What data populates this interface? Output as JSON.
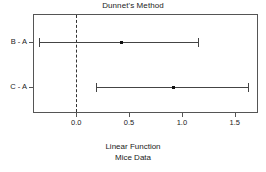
{
  "chart_data": {
    "type": "errorbar",
    "title": "Dunnet's Method",
    "xlabel_line1": "Linear Function",
    "xlabel_line2": "Mice Data",
    "ylabel": "",
    "xlim": [
      -0.4,
      1.73
    ],
    "xticks": [
      0.0,
      0.5,
      1.0,
      1.5
    ],
    "xticklabels": [
      "0.0",
      "0.5",
      "1.0",
      "1.5"
    ],
    "grid": false,
    "legend": "none",
    "reference_line": {
      "value": 0.0,
      "style": "dashed",
      "color": "#333333"
    },
    "categories": [
      "B - A",
      "C - A"
    ],
    "series": [
      {
        "name": "B - A",
        "estimate": 0.42,
        "lower": -0.35,
        "upper": 1.15
      },
      {
        "name": "C - A",
        "estimate": 0.92,
        "lower": 0.19,
        "upper": 1.63
      }
    ],
    "colors": {
      "line": "#444444",
      "point": "#111111",
      "frame": "#555555",
      "text": "#222222",
      "background": "#ffffff"
    }
  }
}
